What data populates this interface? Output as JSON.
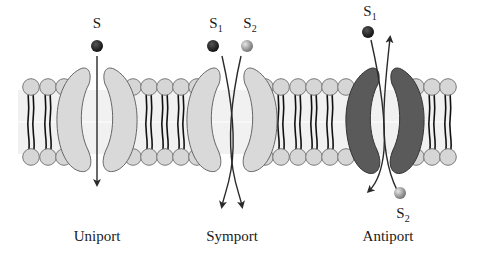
{
  "figure": {
    "colors": {
      "background": "#ffffff",
      "lipid_head_fill": "#d6d6d6",
      "lipid_head_stroke": "#7a7a7a",
      "lipid_tail": "#111111",
      "bilayer_core": "#f1f1f1",
      "carrier_light": "#d9d9d9",
      "carrier_dark": "#5a5a5a",
      "arrow": "#2a2a2a",
      "solute_1": "#1e1e1e",
      "solute_2": "#9a9a9a"
    }
  },
  "panels": [
    {
      "name": "Uniport",
      "label": "Uniport",
      "solutes": [
        {
          "symbol": "S",
          "subscript": "",
          "direction": "down"
        }
      ]
    },
    {
      "name": "Symport",
      "label": "Symport",
      "solutes": [
        {
          "symbol": "S",
          "subscript": "1",
          "direction": "down"
        },
        {
          "symbol": "S",
          "subscript": "2",
          "direction": "down"
        }
      ]
    },
    {
      "name": "Antiport",
      "label": "Antiport",
      "solutes": [
        {
          "symbol": "S",
          "subscript": "1",
          "direction": "down"
        },
        {
          "symbol": "S",
          "subscript": "2",
          "direction": "up"
        }
      ]
    }
  ]
}
